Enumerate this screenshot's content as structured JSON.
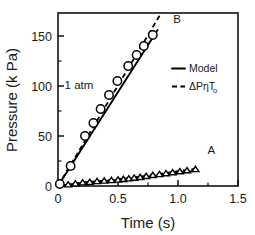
{
  "chart_data": {
    "type": "line",
    "title": "",
    "xlabel": "Time (s)",
    "ylabel": "Pressure (k Pa)",
    "xlim": [
      0,
      1.5
    ],
    "ylim": [
      0,
      173
    ],
    "xticks": [
      0,
      0.5,
      1.0,
      1.5
    ],
    "xticklabels": [
      "0",
      "0.5",
      "1.0",
      "1.5"
    ],
    "yticks": [
      0,
      50,
      100,
      150
    ],
    "yticklabels": [
      "0",
      "50",
      "100",
      "150"
    ],
    "xminorticks": [
      0.25,
      0.75,
      1.25
    ],
    "yminorticks": [
      25,
      75,
      125
    ],
    "grid": false,
    "legend_position": "right-center",
    "legend": [
      {
        "label": "Model",
        "style": "solid"
      },
      {
        "label": "ΔPηT",
        "label_sub": "o",
        "style": "dashed"
      }
    ],
    "annotations": [
      {
        "text": "1 atm",
        "x": 0.055,
        "y": 97
      },
      {
        "text": "B",
        "x": 0.96,
        "y": 163
      },
      {
        "text": "A",
        "x": 1.245,
        "y": 32
      }
    ],
    "series": [
      {
        "name": "B",
        "marker": "circle",
        "marker_points": [
          {
            "x": 0.015,
            "y": 2
          },
          {
            "x": 0.105,
            "y": 20
          },
          {
            "x": 0.225,
            "y": 50
          },
          {
            "x": 0.295,
            "y": 63
          },
          {
            "x": 0.355,
            "y": 77
          },
          {
            "x": 0.425,
            "y": 91
          },
          {
            "x": 0.495,
            "y": 105
          },
          {
            "x": 0.585,
            "y": 120
          },
          {
            "x": 0.655,
            "y": 131
          },
          {
            "x": 0.715,
            "y": 140
          },
          {
            "x": 0.79,
            "y": 151
          }
        ],
        "model_line": [
          {
            "x": 0.0,
            "y": 0
          },
          {
            "x": 0.83,
            "y": 156
          }
        ],
        "dpnt_line": [
          {
            "x": 0.0,
            "y": 0
          },
          {
            "x": 0.86,
            "y": 173
          }
        ]
      },
      {
        "name": "A",
        "marker": "triangle",
        "marker_points": [
          {
            "x": 0.085,
            "y": 1.5
          },
          {
            "x": 0.145,
            "y": 2.5
          },
          {
            "x": 0.205,
            "y": 3.5
          },
          {
            "x": 0.265,
            "y": 4.0
          },
          {
            "x": 0.325,
            "y": 4.8
          },
          {
            "x": 0.385,
            "y": 5.3
          },
          {
            "x": 0.445,
            "y": 5.8
          },
          {
            "x": 0.5,
            "y": 6.3
          },
          {
            "x": 0.545,
            "y": 6.9
          },
          {
            "x": 0.59,
            "y": 7.5
          },
          {
            "x": 0.635,
            "y": 8.2
          },
          {
            "x": 0.685,
            "y": 8.9
          },
          {
            "x": 0.735,
            "y": 9.9
          },
          {
            "x": 0.79,
            "y": 10.9
          },
          {
            "x": 0.845,
            "y": 11.8
          },
          {
            "x": 0.9,
            "y": 12.7
          },
          {
            "x": 0.955,
            "y": 13.6
          },
          {
            "x": 1.015,
            "y": 14.6
          },
          {
            "x": 1.075,
            "y": 15.6
          },
          {
            "x": 1.145,
            "y": 16.8
          }
        ],
        "model_line": [
          {
            "x": 0.0,
            "y": 0
          },
          {
            "x": 0.2,
            "y": 3.0
          },
          {
            "x": 0.5,
            "y": 6.0
          },
          {
            "x": 0.8,
            "y": 10.0
          },
          {
            "x": 1.15,
            "y": 15.2
          }
        ],
        "dpnt_line": [
          {
            "x": 0.0,
            "y": 0
          },
          {
            "x": 0.2,
            "y": 3.4
          },
          {
            "x": 0.5,
            "y": 6.6
          },
          {
            "x": 0.8,
            "y": 11.2
          },
          {
            "x": 1.16,
            "y": 17.6
          }
        ]
      }
    ],
    "rise_segment": [
      {
        "x": 0.0,
        "y": 0
      },
      {
        "x": 0.03,
        "y": 0.6
      }
    ]
  }
}
